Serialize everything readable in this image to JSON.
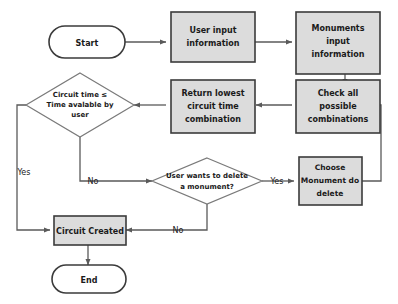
{
  "diagram": {
    "type": "flowchart",
    "colors": {
      "process_fill": "#dcdcdc",
      "process_stroke": "#3b3b3b",
      "terminator_fill": "#ffffff",
      "terminator_stroke": "#3b3b3b",
      "decision_fill": "#ffffff",
      "decision_stroke": "#7a7a7a",
      "connector_stroke": "#5a5a5a",
      "text": "#1a1a1a",
      "background": "#ffffff"
    },
    "nodes": [
      {
        "id": "start",
        "shape": "terminator",
        "label": "Start",
        "lines": [
          "Start"
        ]
      },
      {
        "id": "user-input",
        "shape": "process",
        "label": "User input information",
        "lines": [
          "User input",
          "information"
        ]
      },
      {
        "id": "monuments-input",
        "shape": "process",
        "label": "Monuments input information",
        "lines": [
          "Monuments",
          "input",
          "information"
        ]
      },
      {
        "id": "check-combinations",
        "shape": "process",
        "label": "Check all possible combinations",
        "lines": [
          "Check all",
          "possible",
          "combinations"
        ]
      },
      {
        "id": "return-lowest",
        "shape": "process",
        "label": "Return lowest circuit time combination",
        "lines": [
          "Return lowest",
          "circuit time",
          "combination"
        ]
      },
      {
        "id": "time-check",
        "shape": "decision",
        "label": "Circuit time ≤ Time avalable by user",
        "lines": [
          "Circuit time ≤",
          "Time avalable by",
          "user"
        ]
      },
      {
        "id": "delete-question",
        "shape": "decision",
        "label": "User wants to delete a monument?",
        "lines": [
          "User wants to delete",
          "a monument?"
        ]
      },
      {
        "id": "choose-monument",
        "shape": "process",
        "label": "Choose Monument do delete",
        "lines": [
          "Choose",
          "Monument do",
          "delete"
        ]
      },
      {
        "id": "circuit-created",
        "shape": "process",
        "label": "Circuit Created",
        "lines": [
          "Circuit Created"
        ]
      },
      {
        "id": "end",
        "shape": "terminator",
        "label": "End",
        "lines": [
          "End"
        ]
      }
    ],
    "edges": [
      {
        "id": "e1",
        "from": "start",
        "to": "user-input",
        "label": ""
      },
      {
        "id": "e2",
        "from": "user-input",
        "to": "monuments-input",
        "label": ""
      },
      {
        "id": "e3",
        "from": "monuments-input",
        "to": "check-combinations",
        "label": ""
      },
      {
        "id": "e4",
        "from": "check-combinations",
        "to": "return-lowest",
        "label": ""
      },
      {
        "id": "e5",
        "from": "return-lowest",
        "to": "time-check",
        "label": ""
      },
      {
        "id": "e6",
        "from": "time-check",
        "to": "circuit-created",
        "label": "Yes"
      },
      {
        "id": "e7",
        "from": "time-check",
        "to": "delete-question",
        "label": "No"
      },
      {
        "id": "e8",
        "from": "delete-question",
        "to": "choose-monument",
        "label": "Yes"
      },
      {
        "id": "e9",
        "from": "delete-question",
        "to": "circuit-created",
        "label": "No"
      },
      {
        "id": "e10",
        "from": "choose-monument",
        "to": "check-combinations",
        "label": ""
      },
      {
        "id": "e11",
        "from": "circuit-created",
        "to": "end",
        "label": ""
      }
    ],
    "edge_labels": {
      "yes_time_check": "Yes",
      "no_time_check": "No",
      "yes_delete": "Yes",
      "no_delete": "No"
    }
  }
}
